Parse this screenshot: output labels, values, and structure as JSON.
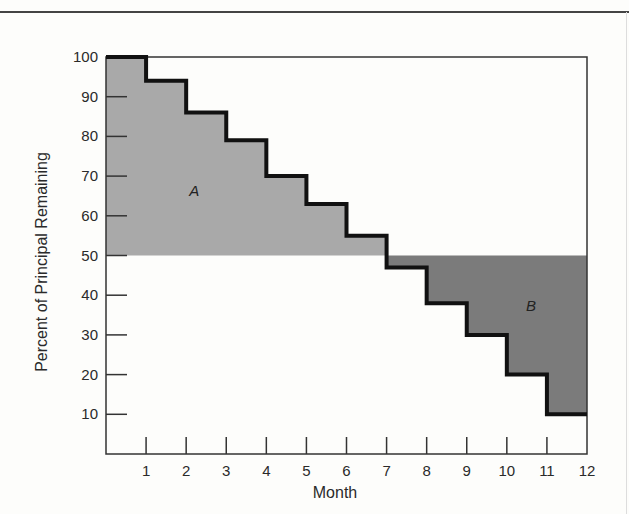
{
  "chart_data": {
    "type": "step",
    "title": "",
    "xlabel": "Month",
    "ylabel": "Percent of Principal Remaining",
    "x_ticks": [
      1,
      2,
      3,
      4,
      5,
      6,
      7,
      8,
      9,
      10,
      11,
      12
    ],
    "y_ticks": [
      10,
      20,
      30,
      40,
      50,
      60,
      70,
      80,
      90,
      100
    ],
    "xlim": [
      0,
      12
    ],
    "ylim": [
      0,
      100
    ],
    "grid": false,
    "series": [
      {
        "name": "Principal remaining",
        "x": [
          0,
          1,
          2,
          3,
          4,
          5,
          6,
          7,
          8,
          9,
          10,
          11,
          12
        ],
        "values": [
          100,
          94,
          86,
          79,
          70,
          63,
          55,
          47,
          38,
          30,
          20,
          10,
          10
        ]
      }
    ],
    "reference_line": {
      "y": 50
    },
    "annotations": [
      {
        "label": "A",
        "description": "shaded area above 50% and below the step curve (months 0–7)",
        "x": 2.2,
        "y": 65
      },
      {
        "label": "B",
        "description": "shaded area below 50% and above the step curve (months 7–12)",
        "x": 10.6,
        "y": 36
      }
    ],
    "colors": {
      "region_a": "#a9a9a9",
      "region_b": "#7b7b7b",
      "step_line": "#111111",
      "axis": "#333333"
    }
  }
}
